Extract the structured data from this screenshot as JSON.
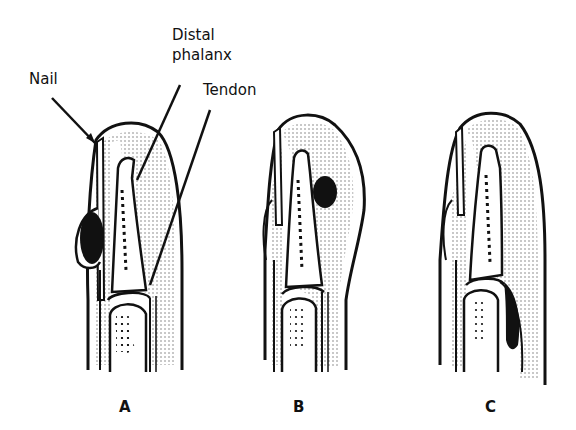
{
  "figure": {
    "annotations": {
      "nail": "Nail",
      "distal_phalanx_line1": "Distal",
      "distal_phalanx_line2": "phalanx",
      "tendon": "Tendon"
    },
    "panels": [
      {
        "id": "A",
        "label": "A",
        "description": "Fingertip cross-section with dark lesion at the nail fold (paronychia)"
      },
      {
        "id": "B",
        "label": "B",
        "description": "Fingertip cross-section with dark lesion in the pulp (felon)"
      },
      {
        "id": "C",
        "label": "C",
        "description": "Fingertip cross-section with dark collection along the tendon sheath"
      }
    ],
    "colors": {
      "ink": "#111111",
      "stipple": "#777777",
      "background": "#ffffff"
    }
  }
}
